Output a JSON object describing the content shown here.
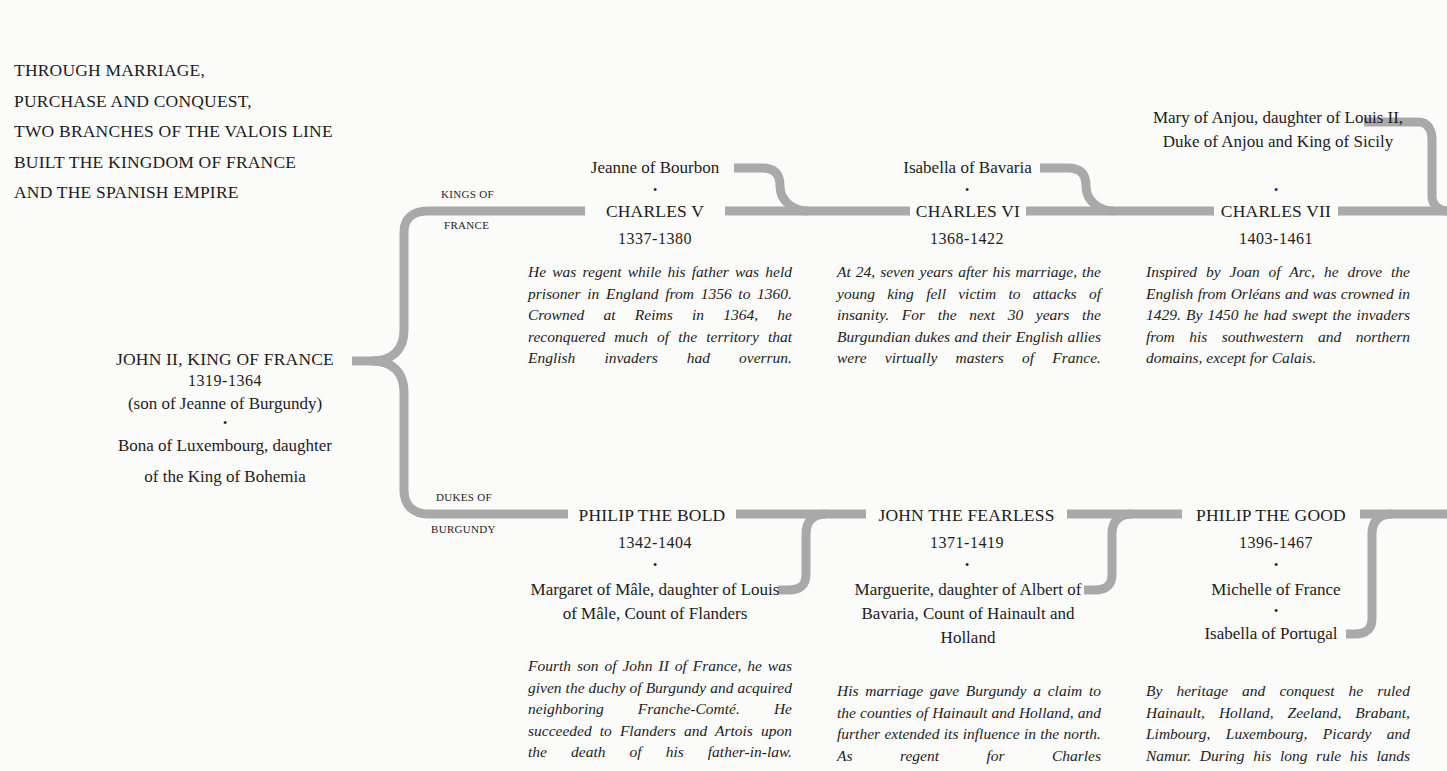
{
  "intro": {
    "lines": [
      "THROUGH MARRIAGE,",
      "PURCHASE AND CONQUEST,",
      "TWO BRANCHES OF THE VALOIS LINE",
      "BUILT THE KINGDOM OF FRANCE",
      "AND THE SPANISH EMPIRE"
    ]
  },
  "colors": {
    "connector": "#a9a9a9",
    "text": "#1c1c1c",
    "background": "#fbfbfa"
  },
  "root": {
    "name": "JOHN II, KING OF FRANCE",
    "years": "1319-1364",
    "note": "(son of Jeanne of Burgundy)",
    "separator": "•",
    "spouse_line1": "Bona of Luxembourg, daughter",
    "spouse_line2": "of the King of Bohemia"
  },
  "branches": {
    "kings": {
      "label_line1": "KINGS OF",
      "label_line2": "FRANCE"
    },
    "dukes": {
      "label_line1": "DUKES OF",
      "label_line2": "BURGUNDY"
    }
  },
  "kings": [
    {
      "spouse": "Jeanne of Bourbon",
      "separator": "•",
      "name": "CHARLES V",
      "years": "1337-1380",
      "bio": "He was regent while his father was held prisoner in England from 1356 to 1360. Crowned at Reims in 1364, he reconquered much of the territory that English invaders had overrun."
    },
    {
      "spouse": "Isabella of Bavaria",
      "separator": "•",
      "name": "CHARLES VI",
      "years": "1368-1422",
      "bio": "At 24, seven years after his marriage, the young king fell victim to attacks of insanity. For the next 30 years the Burgundian dukes and their English allies were virtually masters of France."
    },
    {
      "spouse": "Mary of Anjou, daughter of Louis II, Duke of Anjou and King of Sicily",
      "separator": "•",
      "name": "CHARLES VII",
      "years": "1403-1461",
      "bio": "Inspired by Joan of Arc, he drove the English from Orléans and was crowned in 1429. By 1450 he had swept the invaders from his southwestern and northern domains, except for Calais."
    }
  ],
  "dukes": [
    {
      "name": "PHILIP THE BOLD",
      "years": "1342-1404",
      "separator": "•",
      "spouse": "Margaret of Mâle, daughter of Louis of Mâle, Count of Flanders",
      "bio": "Fourth son of John II of France, he was given the duchy of Burgundy and acquired neighboring Franche-Comté. He succeeded to Flanders and Artois upon the death of his father-in-law."
    },
    {
      "name": "JOHN THE FEARLESS",
      "years": "1371-1419",
      "separator": "•",
      "spouse": "Marguerite, daughter of Albert of Bavaria, Count of Hainault and Holland",
      "bio": "His marriage gave Burgundy a claim to the counties of Hainault and Holland, and further extended its influence in the north. As regent for Charles"
    },
    {
      "name": "PHILIP THE GOOD",
      "years": "1396-1467",
      "separator": "•",
      "spouse": "Michelle of France",
      "separator2": "•",
      "spouse2": "Isabella of Portugal",
      "bio": "By heritage and conquest he ruled Hainault, Holland, Zeeland, Brabant, Limbourg, Luxembourg, Picardy and Namur. During his long rule his lands"
    }
  ]
}
